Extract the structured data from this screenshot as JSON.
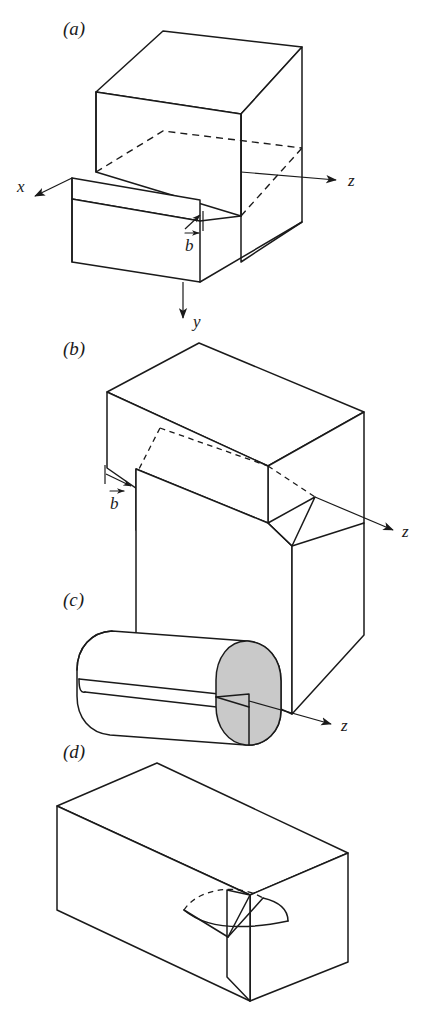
{
  "figure": {
    "background_color": "#ffffff",
    "line_color": "#1a1a1a",
    "shade_color": "#c9c9c9"
  },
  "panels": [
    {
      "id": "a",
      "label": "(a)",
      "description": "edge dislocation in a cube with a slipped step",
      "axes": [
        {
          "name": "x",
          "label": "x"
        },
        {
          "name": "y",
          "label": "y"
        },
        {
          "name": "z",
          "label": "z"
        }
      ],
      "burgers": {
        "label": "b",
        "symbol": "b⃗"
      }
    },
    {
      "id": "b",
      "label": "(b)",
      "description": "screw dislocation in a rectangular block",
      "axes": [
        {
          "name": "z",
          "label": "z"
        }
      ],
      "burgers": {
        "label": "b",
        "symbol": "b⃗"
      }
    },
    {
      "id": "c",
      "label": "(c)",
      "description": "screw dislocation in a cylinder with shaded end face",
      "axes": [
        {
          "name": "z",
          "label": "z"
        }
      ],
      "burgers": null
    },
    {
      "id": "d",
      "label": "(d)",
      "description": "mixed curved dislocation loop in a rectangular block",
      "axes": [],
      "burgers": null
    }
  ],
  "labels": {
    "panel_a": "(a)",
    "panel_b": "(b)",
    "panel_c": "(c)",
    "panel_d": "(d)",
    "axis_x": "x",
    "axis_y": "y",
    "axis_z_a": "z",
    "axis_z_b": "z",
    "axis_z_c": "z",
    "burgers_a": "b",
    "burgers_b": "b"
  }
}
